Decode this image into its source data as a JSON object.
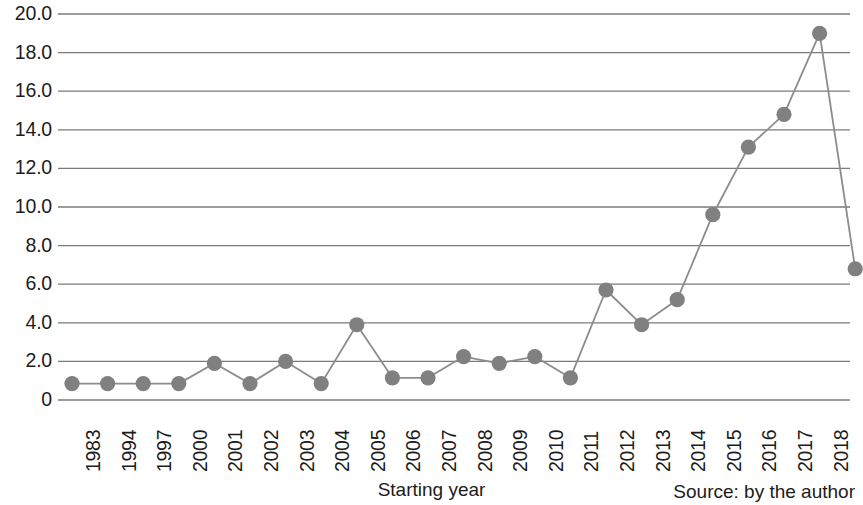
{
  "chart_data": {
    "type": "line",
    "title": "",
    "subtitle": "",
    "xlabel": "Starting year",
    "ylabel": "",
    "categories": [
      "1983",
      "1994",
      "1997",
      "2000",
      "2001",
      "2002",
      "2003",
      "2004",
      "2005",
      "2006",
      "2007",
      "2008",
      "2009",
      "2010",
      "2011",
      "2012",
      "2013",
      "2014",
      "2015",
      "2016",
      "2017",
      "2018",
      "2019"
    ],
    "values": [
      0.85,
      0.85,
      0.85,
      0.85,
      1.9,
      0.85,
      2.0,
      0.85,
      3.9,
      1.15,
      1.15,
      2.25,
      1.9,
      2.25,
      1.15,
      5.7,
      3.9,
      5.2,
      9.6,
      13.1,
      14.8,
      19.0,
      6.8
    ],
    "series": [
      {
        "name": "",
        "values": [
          0.85,
          0.85,
          0.85,
          0.85,
          1.9,
          0.85,
          2.0,
          0.85,
          3.9,
          1.15,
          1.15,
          2.25,
          1.9,
          2.25,
          1.15,
          5.7,
          3.9,
          5.2,
          9.6,
          13.1,
          14.8,
          19.0,
          6.8
        ]
      }
    ],
    "ylim": [
      0,
      20
    ],
    "ytick_values": [
      20,
      18,
      16,
      14,
      12,
      10,
      8,
      6,
      4,
      2,
      0
    ],
    "ytick_labels": [
      "20.0",
      "18.0",
      "16.0",
      "14.0",
      "12.0",
      "10.0",
      "8.0",
      "6.0",
      "4.0",
      "2.0",
      "0"
    ],
    "grid": true,
    "grid_axis": "y",
    "legend": false,
    "legend_position": "none",
    "marker": "circle",
    "marker_color": "#808080",
    "line_color": "#8c8c8c",
    "grid_color": "#7a7a7a",
    "annotations": [
      "Source: by the author"
    ]
  },
  "footer": {
    "axis_title": "Starting year",
    "source_note": "Source: by the author"
  }
}
